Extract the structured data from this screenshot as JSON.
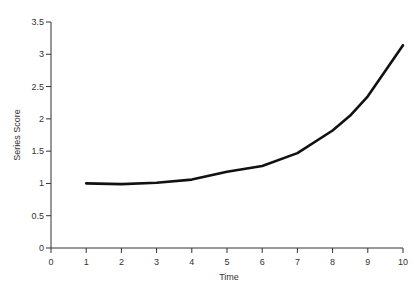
{
  "chart_data": {
    "type": "line",
    "title": "",
    "xlabel": "Time",
    "ylabel": "Series Score",
    "xlim": [
      0,
      10
    ],
    "ylim": [
      0,
      3.5
    ],
    "xticks": [
      "0",
      "1",
      "2",
      "3",
      "4",
      "5",
      "6",
      "7",
      "8",
      "9",
      "10"
    ],
    "yticks": [
      "0",
      "0.5",
      "1",
      "1.5",
      "2",
      "2.5",
      "3",
      "3.5"
    ],
    "grid": false,
    "legend": null,
    "series": [
      {
        "name": "Series Score",
        "color": "#111111",
        "x": [
          1,
          2,
          3,
          4,
          5,
          6,
          7,
          8,
          8.5,
          9,
          10
        ],
        "values": [
          1.0,
          0.99,
          1.01,
          1.06,
          1.18,
          1.27,
          1.47,
          1.82,
          2.05,
          2.35,
          3.14
        ]
      }
    ]
  },
  "colors": {
    "axis": "#333333",
    "line": "#111111",
    "background": "#ffffff"
  }
}
